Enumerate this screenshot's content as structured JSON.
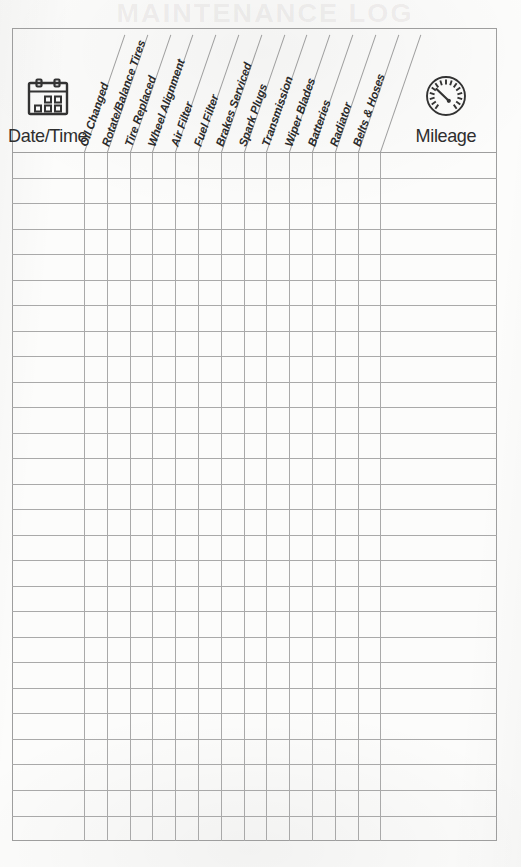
{
  "document": {
    "type": "vehicle-maintenance-log",
    "bleed_through_text": "MAINTENANCE LOG"
  },
  "table": {
    "first_column": {
      "label": "Date/Time",
      "icon": "calendar-icon"
    },
    "last_column": {
      "label": "Mileage",
      "icon": "speedometer-icon"
    },
    "service_columns": [
      {
        "label": "Oil Changed"
      },
      {
        "label": "Rotate/Balance Tires"
      },
      {
        "label": "Tire Replaced"
      },
      {
        "label": "Wheel Alignment"
      },
      {
        "label": "Air Filter"
      },
      {
        "label": "Fuel Filter"
      },
      {
        "label": "Brakes Serviced"
      },
      {
        "label": "Spark Plugs"
      },
      {
        "label": "Transmission"
      },
      {
        "label": "Wiper Blades"
      },
      {
        "label": "Batteries"
      },
      {
        "label": "Radiator"
      },
      {
        "label": "Belts & Hoses"
      }
    ],
    "row_count": 27,
    "rows": [
      {
        "date_time": "",
        "mileage": "",
        "checks": [
          "",
          "",
          "",
          "",
          "",
          "",
          "",
          "",
          "",
          "",
          "",
          "",
          ""
        ]
      },
      {
        "date_time": "",
        "mileage": "",
        "checks": [
          "",
          "",
          "",
          "",
          "",
          "",
          "",
          "",
          "",
          "",
          "",
          "",
          ""
        ]
      },
      {
        "date_time": "",
        "mileage": "",
        "checks": [
          "",
          "",
          "",
          "",
          "",
          "",
          "",
          "",
          "",
          "",
          "",
          "",
          ""
        ]
      },
      {
        "date_time": "",
        "mileage": "",
        "checks": [
          "",
          "",
          "",
          "",
          "",
          "",
          "",
          "",
          "",
          "",
          "",
          "",
          ""
        ]
      },
      {
        "date_time": "",
        "mileage": "",
        "checks": [
          "",
          "",
          "",
          "",
          "",
          "",
          "",
          "",
          "",
          "",
          "",
          "",
          ""
        ]
      },
      {
        "date_time": "",
        "mileage": "",
        "checks": [
          "",
          "",
          "",
          "",
          "",
          "",
          "",
          "",
          "",
          "",
          "",
          "",
          ""
        ]
      },
      {
        "date_time": "",
        "mileage": "",
        "checks": [
          "",
          "",
          "",
          "",
          "",
          "",
          "",
          "",
          "",
          "",
          "",
          "",
          ""
        ]
      },
      {
        "date_time": "",
        "mileage": "",
        "checks": [
          "",
          "",
          "",
          "",
          "",
          "",
          "",
          "",
          "",
          "",
          "",
          "",
          ""
        ]
      },
      {
        "date_time": "",
        "mileage": "",
        "checks": [
          "",
          "",
          "",
          "",
          "",
          "",
          "",
          "",
          "",
          "",
          "",
          "",
          ""
        ]
      },
      {
        "date_time": "",
        "mileage": "",
        "checks": [
          "",
          "",
          "",
          "",
          "",
          "",
          "",
          "",
          "",
          "",
          "",
          "",
          ""
        ]
      },
      {
        "date_time": "",
        "mileage": "",
        "checks": [
          "",
          "",
          "",
          "",
          "",
          "",
          "",
          "",
          "",
          "",
          "",
          "",
          ""
        ]
      },
      {
        "date_time": "",
        "mileage": "",
        "checks": [
          "",
          "",
          "",
          "",
          "",
          "",
          "",
          "",
          "",
          "",
          "",
          "",
          ""
        ]
      },
      {
        "date_time": "",
        "mileage": "",
        "checks": [
          "",
          "",
          "",
          "",
          "",
          "",
          "",
          "",
          "",
          "",
          "",
          "",
          ""
        ]
      },
      {
        "date_time": "",
        "mileage": "",
        "checks": [
          "",
          "",
          "",
          "",
          "",
          "",
          "",
          "",
          "",
          "",
          "",
          "",
          ""
        ]
      },
      {
        "date_time": "",
        "mileage": "",
        "checks": [
          "",
          "",
          "",
          "",
          "",
          "",
          "",
          "",
          "",
          "",
          "",
          "",
          ""
        ]
      },
      {
        "date_time": "",
        "mileage": "",
        "checks": [
          "",
          "",
          "",
          "",
          "",
          "",
          "",
          "",
          "",
          "",
          "",
          "",
          ""
        ]
      },
      {
        "date_time": "",
        "mileage": "",
        "checks": [
          "",
          "",
          "",
          "",
          "",
          "",
          "",
          "",
          "",
          "",
          "",
          "",
          ""
        ]
      },
      {
        "date_time": "",
        "mileage": "",
        "checks": [
          "",
          "",
          "",
          "",
          "",
          "",
          "",
          "",
          "",
          "",
          "",
          "",
          ""
        ]
      },
      {
        "date_time": "",
        "mileage": "",
        "checks": [
          "",
          "",
          "",
          "",
          "",
          "",
          "",
          "",
          "",
          "",
          "",
          "",
          ""
        ]
      },
      {
        "date_time": "",
        "mileage": "",
        "checks": [
          "",
          "",
          "",
          "",
          "",
          "",
          "",
          "",
          "",
          "",
          "",
          "",
          ""
        ]
      },
      {
        "date_time": "",
        "mileage": "",
        "checks": [
          "",
          "",
          "",
          "",
          "",
          "",
          "",
          "",
          "",
          "",
          "",
          "",
          ""
        ]
      },
      {
        "date_time": "",
        "mileage": "",
        "checks": [
          "",
          "",
          "",
          "",
          "",
          "",
          "",
          "",
          "",
          "",
          "",
          "",
          ""
        ]
      },
      {
        "date_time": "",
        "mileage": "",
        "checks": [
          "",
          "",
          "",
          "",
          "",
          "",
          "",
          "",
          "",
          "",
          "",
          "",
          ""
        ]
      },
      {
        "date_time": "",
        "mileage": "",
        "checks": [
          "",
          "",
          "",
          "",
          "",
          "",
          "",
          "",
          "",
          "",
          "",
          "",
          ""
        ]
      },
      {
        "date_time": "",
        "mileage": "",
        "checks": [
          "",
          "",
          "",
          "",
          "",
          "",
          "",
          "",
          "",
          "",
          "",
          "",
          ""
        ]
      },
      {
        "date_time": "",
        "mileage": "",
        "checks": [
          "",
          "",
          "",
          "",
          "",
          "",
          "",
          "",
          "",
          "",
          "",
          "",
          ""
        ]
      },
      {
        "date_time": "",
        "mileage": "",
        "checks": [
          "",
          "",
          "",
          "",
          "",
          "",
          "",
          "",
          "",
          "",
          "",
          "",
          ""
        ]
      }
    ]
  },
  "colors": {
    "paper": "#fcfcfb",
    "grid_line": "#a9a9a9",
    "border": "#9e9e9e",
    "ink": "#2b2b2b"
  },
  "geometry": {
    "table_left": 12,
    "table_right": 497,
    "table_top": 28,
    "table_bottom": 841,
    "header_bottom": 152,
    "service_col_start": 84,
    "service_col_width": 22.8,
    "row_height": 25.52
  }
}
